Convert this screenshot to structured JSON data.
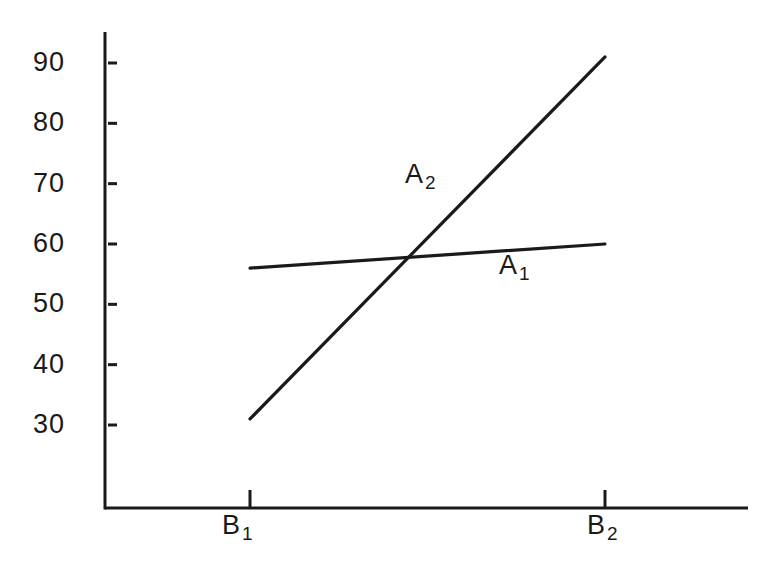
{
  "figure": {
    "background": "#ffffff",
    "ink_color": "#1a1a1a"
  },
  "chart_data": {
    "type": "line",
    "title": "",
    "xlabel": "",
    "ylabel": "",
    "categories": [
      {
        "base": "B",
        "sub": "1"
      },
      {
        "base": "B",
        "sub": "2"
      }
    ],
    "yticks": [
      30,
      40,
      50,
      60,
      70,
      80,
      90
    ],
    "ylim": [
      30,
      90
    ],
    "grid": false,
    "legend": "inline-labels",
    "series": [
      {
        "name": "A1",
        "label_base": "A",
        "label_sub": "1",
        "values": [
          56,
          60
        ]
      },
      {
        "name": "A2",
        "label_base": "A",
        "label_sub": "2",
        "values": [
          31,
          91
        ]
      }
    ],
    "intersection_approx": {
      "between": "B1-B2",
      "value": 58
    },
    "line_color": "#1a1a1a"
  }
}
